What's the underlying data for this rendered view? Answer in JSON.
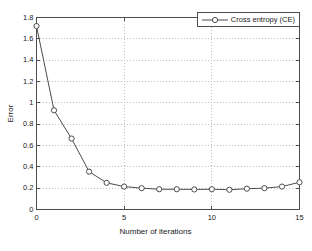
{
  "chart_data": {
    "type": "line",
    "title": "",
    "xlabel": "Number of iterations",
    "ylabel": "Error",
    "xlim": [
      0,
      15
    ],
    "ylim": [
      0,
      1.8
    ],
    "grid": true,
    "legend_position": "upper-right",
    "xticks": [
      "0",
      "5",
      "10",
      "15"
    ],
    "xtick_values": [
      0,
      5,
      10,
      15
    ],
    "yticks": [
      "0",
      "0.2",
      "0.4",
      "0.6",
      "0.8",
      "1",
      "1.2",
      "1.4",
      "1.6",
      "1.8"
    ],
    "ytick_values": [
      0,
      0.2,
      0.4,
      0.6,
      0.8,
      1,
      1.2,
      1.4,
      1.6,
      1.8
    ],
    "x": [
      0,
      1,
      2,
      3,
      4,
      5,
      6,
      7,
      8,
      9,
      10,
      11,
      12,
      13,
      14,
      15
    ],
    "series": [
      {
        "name": "Cross entropy (CE)",
        "marker": "circle-open",
        "color": "#4d4d4d",
        "values": [
          1.72,
          0.93,
          0.665,
          0.355,
          0.25,
          0.215,
          0.2,
          0.19,
          0.19,
          0.188,
          0.19,
          0.185,
          0.195,
          0.2,
          0.215,
          0.255
        ]
      }
    ]
  },
  "legend": {
    "entries": [
      {
        "label": "Cross entropy (CE)"
      }
    ]
  },
  "axis_labels": {
    "x": "Number of iterations",
    "y": "Error"
  },
  "colors": {
    "axis": "#4d4d4d",
    "grid": "#b0b0b0",
    "line": "#4d4d4d",
    "background": "#ffffff"
  }
}
